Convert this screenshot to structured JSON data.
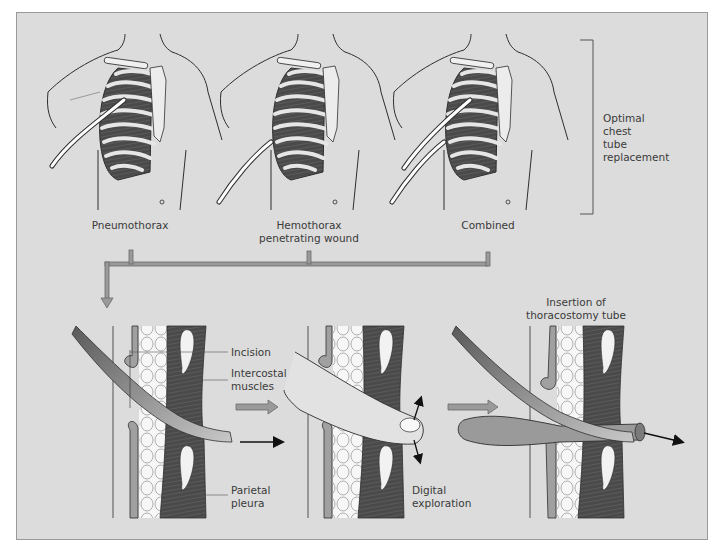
{
  "figure": {
    "colors": {
      "background": "#dcdcdc",
      "frame_border": "#9a9a9a",
      "line": "#2e2e2e",
      "muscle": "#4a4a4a",
      "rib": "#e6e6e6",
      "bone_fill": "#f2f2f2",
      "tube_fill": "#ffffff",
      "flow_arrow": "#8c8c8c",
      "clamp": "#8a8a8a",
      "text": "#3a3a3a"
    },
    "top_row": {
      "panels": [
        {
          "id": "pneumothorax",
          "caption": "Pneumothorax"
        },
        {
          "id": "hemothorax",
          "caption": "Hemothorax\npenetrating wound"
        },
        {
          "id": "combined",
          "caption": "Combined"
        }
      ],
      "bracket_label": "Optimal\nchest\ntube\nreplacement"
    },
    "bottom_row": {
      "steps": [
        {
          "id": "incision",
          "labels": {
            "incision": "Incision",
            "intercostal_muscles": "Intercostal\nmuscles",
            "parietal_pleura": "Parietal\npleura"
          }
        },
        {
          "id": "digital-exploration",
          "labels": {
            "digital_exploration": "Digital\nexploration"
          }
        },
        {
          "id": "insertion",
          "labels": {
            "title": "Insertion of\nthoracostomy tube"
          }
        }
      ]
    }
  }
}
